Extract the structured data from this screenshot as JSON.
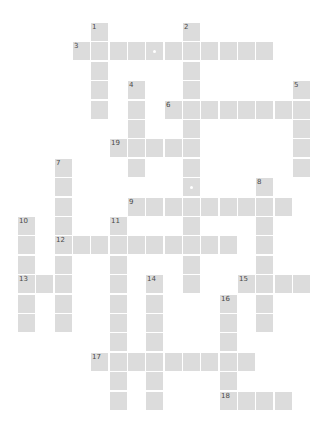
{
  "puzzle": {
    "type": "crossword",
    "grid": {
      "origin_x": 18,
      "origin_y": 23,
      "step_x": 18.33,
      "step_y": 19.4,
      "cell_w": 17,
      "cell_h": 18
    },
    "colors": {
      "cell": "#dcdcdc",
      "number": "#4a4a4a",
      "background": "#ffffff",
      "marker": "#ffffff"
    },
    "words": [
      {
        "number": "1",
        "direction": "down",
        "row": 0,
        "col": 4,
        "length": 5
      },
      {
        "number": "2",
        "direction": "down",
        "row": 0,
        "col": 9,
        "length": 14
      },
      {
        "number": "3",
        "direction": "across",
        "row": 1,
        "col": 3,
        "length": 11
      },
      {
        "number": "4",
        "direction": "down",
        "row": 3,
        "col": 6,
        "length": 5
      },
      {
        "number": "5",
        "direction": "down",
        "row": 3,
        "col": 15,
        "length": 5
      },
      {
        "number": "6",
        "direction": "across",
        "row": 4,
        "col": 8,
        "length": 8
      },
      {
        "number": "7",
        "direction": "down",
        "row": 7,
        "col": 2,
        "length": 9
      },
      {
        "number": "8",
        "direction": "down",
        "row": 8,
        "col": 13,
        "length": 8
      },
      {
        "number": "9",
        "direction": "across",
        "row": 9,
        "col": 6,
        "length": 9
      },
      {
        "number": "10",
        "direction": "down",
        "row": 10,
        "col": 0,
        "length": 6
      },
      {
        "number": "11",
        "direction": "down",
        "row": 10,
        "col": 5,
        "length": 10
      },
      {
        "number": "12",
        "direction": "across",
        "row": 11,
        "col": 2,
        "length": 10
      },
      {
        "number": "13",
        "direction": "across",
        "row": 13,
        "col": 0,
        "length": 3
      },
      {
        "number": "14",
        "direction": "down",
        "row": 13,
        "col": 7,
        "length": 7
      },
      {
        "number": "15",
        "direction": "across",
        "row": 13,
        "col": 12,
        "length": 4
      },
      {
        "number": "16",
        "direction": "down",
        "row": 14,
        "col": 11,
        "length": 6
      },
      {
        "number": "17",
        "direction": "across",
        "row": 17,
        "col": 4,
        "length": 9
      },
      {
        "number": "18",
        "direction": "across",
        "row": 19,
        "col": 11,
        "length": 4
      },
      {
        "number": "19",
        "direction": "across",
        "row": 6,
        "col": 5,
        "length": 5
      }
    ],
    "markers": [
      {
        "row": 1,
        "col": 7
      },
      {
        "row": 8,
        "col": 9
      }
    ]
  }
}
